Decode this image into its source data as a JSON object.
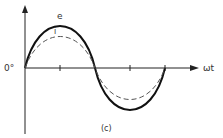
{
  "figure": {
    "caption": "(c)",
    "origin_label": "0°",
    "x_axis_label": "ωt",
    "curves": [
      {
        "name": "e",
        "label": "e",
        "style": "solid",
        "amplitude_px": 48
      },
      {
        "name": "i",
        "label": "i",
        "style": "dashed",
        "amplitude_px": 36
      }
    ],
    "colors": {
      "line": "#1a1a1a",
      "dashed": "#555555"
    }
  }
}
